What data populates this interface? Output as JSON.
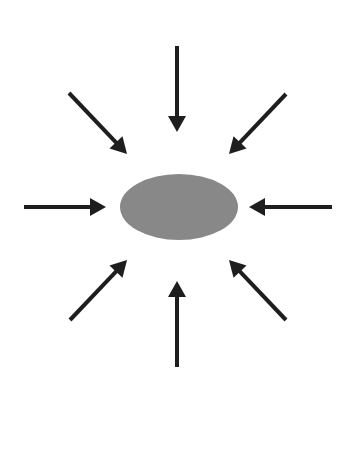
{
  "canvas": {
    "width": 356,
    "height": 471,
    "background": "#ffffff"
  },
  "center_shape": {
    "type": "ellipse",
    "cx": 179,
    "cy": 207,
    "rx": 59,
    "ry": 33,
    "fill": "#888888"
  },
  "arrow_style": {
    "color": "#1e1e1e",
    "stroke_width": 4,
    "head_length": 16,
    "head_width": 18
  },
  "arrows": [
    {
      "name": "arrow-top",
      "x1": 177,
      "y1": 46,
      "x2": 177,
      "y2": 132
    },
    {
      "name": "arrow-top-right",
      "x1": 286,
      "y1": 94,
      "x2": 229,
      "y2": 154
    },
    {
      "name": "arrow-right",
      "x1": 332,
      "y1": 207,
      "x2": 249,
      "y2": 207
    },
    {
      "name": "arrow-bottom-right",
      "x1": 286,
      "y1": 320,
      "x2": 229,
      "y2": 260
    },
    {
      "name": "arrow-bottom",
      "x1": 177,
      "y1": 367,
      "x2": 177,
      "y2": 281
    },
    {
      "name": "arrow-bottom-left",
      "x1": 70,
      "y1": 320,
      "x2": 127,
      "y2": 260
    },
    {
      "name": "arrow-left",
      "x1": 24,
      "y1": 207,
      "x2": 106,
      "y2": 207
    },
    {
      "name": "arrow-top-left",
      "x1": 69,
      "y1": 93,
      "x2": 127,
      "y2": 154
    }
  ]
}
